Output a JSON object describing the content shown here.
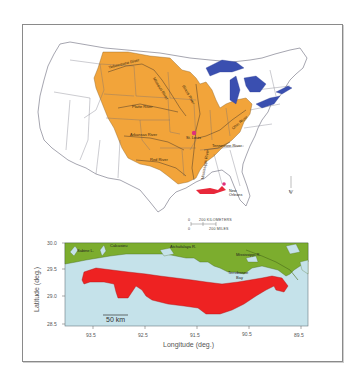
{
  "figure": {
    "upper_map": {
      "title": "Mississippi River drainage basin",
      "colors": {
        "basin": "#f2a43a",
        "lakes": "#3a4fb0",
        "state_lines": "#6a6a7a",
        "hypoxia_zone": "#e8283a",
        "city_marker": "#e0307a"
      },
      "river_labels": [
        "Yellowstone River",
        "Missouri River",
        "Platte River",
        "Arkansas River",
        "Red River",
        "Mississippi River",
        "Ohio River",
        "Tennessee River",
        "Illinois River"
      ],
      "cities": [
        {
          "name": "St. Louis"
        },
        {
          "name_line1": "New",
          "name_line2": "Orleans"
        }
      ],
      "scale_bar": {
        "zero": "0",
        "km_label": "200 KILOMETERS",
        "mi_label": "200 MILES"
      },
      "north_arrow": "N"
    },
    "lower_map": {
      "colors": {
        "land": "#7cad2e",
        "water": "#c5e2ea",
        "hypoxia_zone": "#ee2222"
      },
      "place_labels": {
        "sabine": "Sabine L.",
        "calcasieu": "Calcasieu",
        "atchafalaya": "Atchafalaya R.",
        "mississippi": "Mississippi R.",
        "terrebonne_1": "Terrebonne",
        "terrebonne_2": "Bay"
      },
      "scale_label": "50 km",
      "y_axis": {
        "title": "Latitude (deg.)",
        "ticks": [
          "30.0",
          "29.5",
          "29.0",
          "28.5"
        ]
      },
      "x_axis": {
        "title": "Longitude (deg.)",
        "ticks": [
          "93.5",
          "92.5",
          "91.5",
          "90.5",
          "89.5"
        ]
      }
    }
  }
}
